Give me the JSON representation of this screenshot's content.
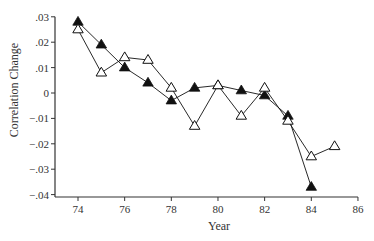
{
  "chart_data": {
    "type": "line",
    "title": "",
    "xlabel": "Year",
    "ylabel": "Correlation Change",
    "xlim": [
      73,
      86
    ],
    "ylim": [
      -0.04,
      0.03
    ],
    "x_ticks": [
      74,
      76,
      78,
      80,
      82,
      84,
      86
    ],
    "x_tick_labels": [
      "74",
      "76",
      "78",
      "80",
      "82",
      "84",
      "86"
    ],
    "y_ticks": [
      0.03,
      0.02,
      0.01,
      0,
      -0.01,
      -0.02,
      -0.03,
      -0.04
    ],
    "y_tick_labels": [
      ".03",
      ".02",
      ".01",
      "0",
      "−.01",
      "−.02",
      "−.03",
      "−.04"
    ],
    "grid": false,
    "legend": null,
    "series": [
      {
        "name": "filled-triangles",
        "marker": "filled-triangle",
        "color": "#111111",
        "x": [
          74,
          75,
          76,
          77,
          78,
          79,
          80,
          81,
          82,
          83,
          84
        ],
        "values": [
          0.028,
          0.019,
          0.01,
          0.004,
          -0.003,
          0.002,
          0.003,
          0.001,
          -0.001,
          -0.009,
          -0.037
        ]
      },
      {
        "name": "open-triangles",
        "marker": "open-triangle",
        "color": "#111111",
        "x": [
          74,
          75,
          76,
          77,
          78,
          79,
          80,
          81,
          82,
          83,
          84,
          85
        ],
        "values": [
          0.025,
          0.008,
          0.014,
          0.013,
          0.002,
          -0.013,
          0.003,
          -0.009,
          0.002,
          -0.011,
          -0.025,
          -0.021
        ]
      }
    ]
  }
}
